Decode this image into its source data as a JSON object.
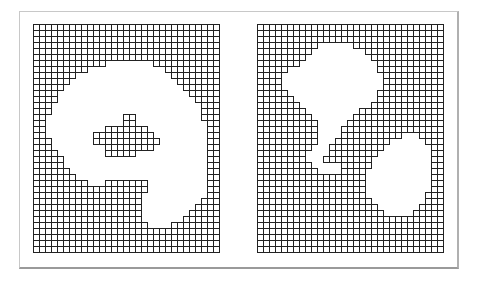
{
  "figure": {
    "cell_size_px": 6,
    "cols": 31,
    "rows": 38,
    "line_color": "#222222",
    "background_color": "#ffffff",
    "frame_color": "#c8c8c8"
  },
  "panels": [
    {
      "id": "left",
      "description": "grid with large hole containing a small island",
      "mask": [
        "1111111111111111111111111111111",
        "1111111111111111111111111111111",
        "1111111111111111111111111111111",
        "1111111111111111111111111111111",
        "1111111111111111111111111111111",
        "1111111111111111111111111111111",
        "1111111111110000000011111111111",
        "1111111110000000000000111111111",
        "1111111000000000000000011111111",
        "1111110000000000000000001111111",
        "1111100000000000000000000111111",
        "1111000000000000000000000011111",
        "1111000000000000000000000001111",
        "1110000000000000000000000000111",
        "1110000000000000000000000000111",
        "1100000000000001100000000000111",
        "1100000000000001100000000000011",
        "1100000000001111111000000000011",
        "1100000000111111111100000000011",
        "1110000000111111111110000000011",
        "1110000000001111111100000000011",
        "1111000000001111100000000000011",
        "1111100000000000000000000000011",
        "1111100000000000000000000000011",
        "1111110000000000000000000000011",
        "1111111000000000000000000000011",
        "1111111110001111111000000000011",
        "1111111111111111111000000000011",
        "1111111111111111110000000000011",
        "1111111111111111110000000000111",
        "1111111111111111110000000001111",
        "1111111111111111110000000011111",
        "1111111111111111110000000111111",
        "1111111111111111111000011111111",
        "1111111111111111111111111111111",
        "1111111111111111111111111111111",
        "1111111111111111111111111111111",
        "1111111111111111111111111111111"
      ]
    },
    {
      "id": "right",
      "description": "grid with two separate holes",
      "mask": [
        "1111111111111111111111111111111",
        "1111111111111111111111111111111",
        "1111111111111111111111111111111",
        "1111111111000000111111111111111",
        "1111111110000000001111111111111",
        "1111111100000000000111111111111",
        "1111111000000000000011111111111",
        "1111100000000000000011111111111",
        "1111000000000000000001111111111",
        "1111000000000000000001111111111",
        "1111000000000000000001111111111",
        "1111100000000000000011111111111",
        "1111110000000000000011111111111",
        "1111111000000000000111111111111",
        "1111111100000000011111111111111",
        "1111111110000000111111111111111",
        "1111111111000001111111111111111",
        "1111111111000011111111111111111",
        "1111111111000011111111110001111",
        "1111111111000111111111000000111",
        "1111111110001111111110000000011",
        "1111111100001111111100000000011",
        "1111111100011111111000000000011",
        "1111111110000011111000000000011",
        "1111111111000011110000000000011",
        "1111111111111111110000000000011",
        "1111111111111111110000000000011",
        "1111111111111111110000000000011",
        "1111111111111111110000000000111",
        "1111111111111111111000000000111",
        "1111111111111111111100000001111",
        "1111111111111111111110000011111",
        "1111111111111111111111111111111",
        "1111111111111111111111111111111",
        "1111111111111111111111111111111",
        "1111111111111111111111111111111",
        "1111111111111111111111111111111",
        "1111111111111111111111111111111"
      ]
    }
  ]
}
